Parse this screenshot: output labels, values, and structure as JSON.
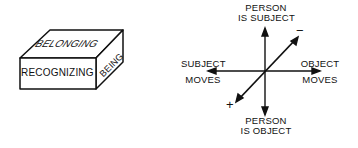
{
  "box": {
    "top_face": "BELONGING",
    "front_face": "RECOGNIZING",
    "side_face": "BEING"
  },
  "axes": {
    "top": [
      "PERSON",
      "IS SUBJECT"
    ],
    "bottom": [
      "PERSON",
      "IS OBJECT"
    ],
    "left": [
      "SUBJECT",
      "MOVES"
    ],
    "right": [
      "OBJECT",
      "MOVES"
    ],
    "diag_neg": "−",
    "diag_pos": "+"
  }
}
